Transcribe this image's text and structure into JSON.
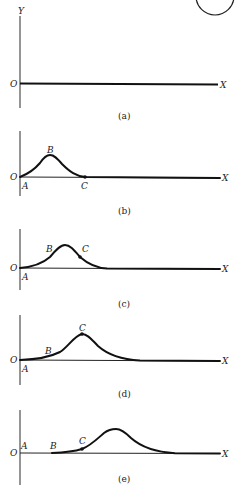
{
  "figure": {
    "axis_labels": {
      "y": "Y",
      "x": "X",
      "origin": "O"
    },
    "panels": [
      {
        "id": "a",
        "caption": "(a)",
        "state": "undisturbed string lying along X axis",
        "points": []
      },
      {
        "id": "b",
        "caption": "(b)",
        "state": "pulse created near origin",
        "points": [
          {
            "label": "A",
            "position": "origin, on axis"
          },
          {
            "label": "B",
            "position": "crest of pulse"
          },
          {
            "label": "C",
            "position": "leading edge, on axis",
            "marked": true
          }
        ]
      },
      {
        "id": "c",
        "caption": "(c)",
        "state": "pulse moved right",
        "points": [
          {
            "label": "A",
            "position": "origin, on axis"
          },
          {
            "label": "B",
            "position": "trailing slope"
          },
          {
            "label": "C",
            "position": "leading slope",
            "marked": true
          }
        ]
      },
      {
        "id": "d",
        "caption": "(d)",
        "state": "crest reaches point C",
        "points": [
          {
            "label": "A",
            "position": "origin, on axis"
          },
          {
            "label": "B",
            "position": "trailing tail"
          },
          {
            "label": "C",
            "position": "crest of pulse",
            "marked": true
          }
        ]
      },
      {
        "id": "e",
        "caption": "(e)",
        "state": "pulse has passed C",
        "points": [
          {
            "label": "A",
            "position": "origin, on axis"
          },
          {
            "label": "B",
            "position": "on axis, behind pulse"
          },
          {
            "label": "C",
            "position": "trailing slope",
            "marked": true
          }
        ]
      }
    ]
  }
}
